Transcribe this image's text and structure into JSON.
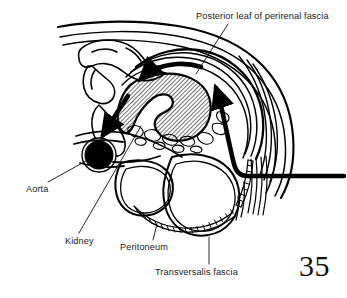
{
  "figure": {
    "page_number": "35",
    "background_color": "#ffffff",
    "ink_color": "#000000",
    "labels": [
      {
        "id": "posterior-leaf",
        "text": "Posterior leaf of perirenal fascia",
        "position": "top-right",
        "leader": "diagonal line running down-left to the posterior perirenal fascia layer"
      },
      {
        "id": "aorta",
        "text": "Aorta",
        "position": "left",
        "leader": "diagonal line running up-right to the solid black vessel"
      },
      {
        "id": "kidney",
        "text": "Kidney",
        "position": "bottom-left",
        "leader": "long diagonal line running up-right to the hatched renal hilum"
      },
      {
        "id": "peritoneum",
        "text": "Peritoneum",
        "position": "bottom-center",
        "leader": "short vertical line up to the beaded peritoneal line"
      },
      {
        "id": "transversalis",
        "text": "Transversalis fascia",
        "position": "bottom-right",
        "leader": "vertical line up to the striated fascial layer"
      }
    ],
    "structures": [
      {
        "name": "kidney",
        "rendering": "diagonal-hatched C-shape with hilar notch opening to the lower left"
      },
      {
        "name": "aorta",
        "rendering": "solid black filled circle with white outline ring"
      },
      {
        "name": "peritoneum",
        "rendering": "beaded ladder line along the inferior bowel margin"
      },
      {
        "name": "transversalis-fascia",
        "rendering": "fine parallel striations at lower right"
      },
      {
        "name": "perirenal-fascia",
        "rendering": "concentric curved layered lines wrapping the kidney"
      },
      {
        "name": "bowel-loops",
        "rendering": "two large rounded double-outlined loops below the kidney"
      },
      {
        "name": "vertebral-body",
        "rendering": "irregular rounded outline at the upper left"
      },
      {
        "name": "flank-arrow-left",
        "rendering": "thick curved black arrow pointing left across the top"
      },
      {
        "name": "flank-arrow-right",
        "rendering": "thick black arrow curving up at the right with a long horizontal tail"
      },
      {
        "name": "flank-arrow-aorta",
        "rendering": "thick black arrow pointing down-left toward the aorta"
      }
    ]
  }
}
